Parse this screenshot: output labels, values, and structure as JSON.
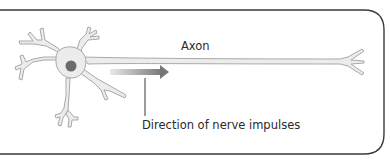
{
  "diagram": {
    "labels": {
      "axon": "Axon",
      "direction": "Direction of nerve impulses"
    },
    "colors": {
      "frame": "#3a3a3a",
      "neuron_fill": "#ececec",
      "neuron_outline": "#a9a9a9",
      "nucleus": "#6b6b6b",
      "arrow_start": "#e6e6e6",
      "arrow_end": "#7a7a7a",
      "text": "#2a2a2a"
    }
  }
}
